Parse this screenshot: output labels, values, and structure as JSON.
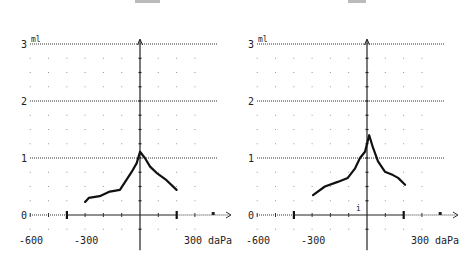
{
  "chart_data": [
    {
      "type": "line",
      "title": "",
      "xlabel": "daPa",
      "ylabel": "ml",
      "xlim": [
        -600,
        400
      ],
      "ylim": [
        0,
        3
      ],
      "x_tick_labels": [
        "-600",
        "-300",
        "300"
      ],
      "y_tick_labels": [
        "0",
        "1",
        "2",
        "3"
      ],
      "grid": "dotted",
      "range_markers_daPa": [
        -400,
        200
      ],
      "series": [
        {
          "name": "tympanogram-left",
          "x": [
            -300,
            -280,
            -220,
            -165,
            -110,
            -75,
            -45,
            -18,
            0,
            27,
            55,
            90,
            145,
            200
          ],
          "y": [
            0.23,
            0.3,
            0.33,
            0.41,
            0.44,
            0.61,
            0.76,
            0.91,
            1.11,
            1.0,
            0.85,
            0.74,
            0.61,
            0.44
          ]
        }
      ]
    },
    {
      "type": "line",
      "title": "",
      "xlabel": "daPa",
      "ylabel": "ml",
      "xlim": [
        -600,
        400
      ],
      "ylim": [
        0,
        3
      ],
      "x_tick_labels": [
        "-600",
        "-300",
        "300"
      ],
      "y_tick_labels": [
        "0",
        "1",
        "2",
        "3"
      ],
      "grid": "dotted",
      "range_markers_daPa": [
        -400,
        200
      ],
      "series": [
        {
          "name": "tympanogram-right",
          "x": [
            -295,
            -230,
            -160,
            -105,
            -65,
            -38,
            -11,
            12,
            33,
            60,
            98,
            142,
            170,
            208
          ],
          "y": [
            0.35,
            0.5,
            0.58,
            0.65,
            0.82,
            1.0,
            1.11,
            1.4,
            1.18,
            0.94,
            0.76,
            0.7,
            0.65,
            0.53
          ]
        }
      ]
    }
  ],
  "labels": {
    "unit_y": "ml",
    "unit_x": "daPa",
    "y_ticks": [
      "3",
      "2",
      "1",
      "0"
    ],
    "x_ticks": [
      "-600",
      "-300",
      "300"
    ]
  }
}
